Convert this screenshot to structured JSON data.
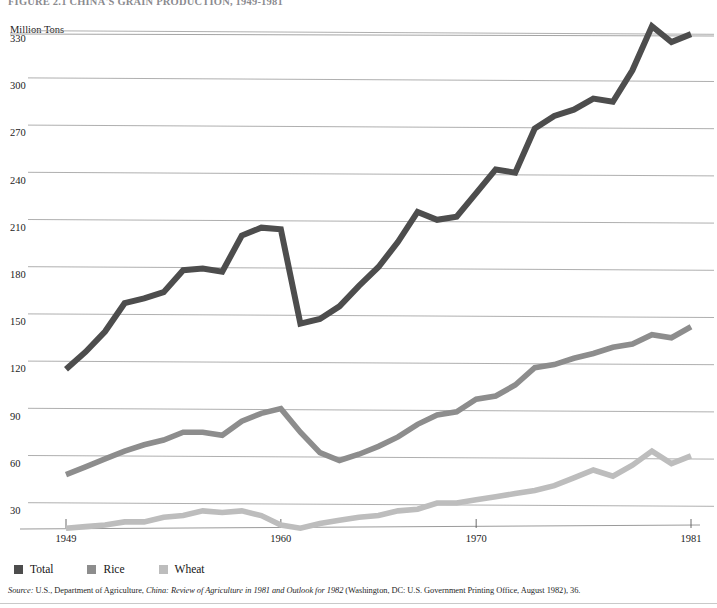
{
  "figure": {
    "title": "FIGURE 2.1 CHINA'S GRAIN PRODUCTION, 1949-1981",
    "unit_label": "Million Tons",
    "source_prefix": "Source:",
    "source_text_1": " U.S., Department of Agriculture, ",
    "source_italic": "China: Review of Agriculture in 1981 and Outlook for 1982",
    "source_text_2": " (Washington, DC: U.S. Government Printing Office, August 1982), 36."
  },
  "legend": {
    "position": "bottom-left",
    "items": [
      {
        "label": "Total",
        "color": "#4d4d4d"
      },
      {
        "label": "Rice",
        "color": "#8d8d8d"
      },
      {
        "label": "Wheat",
        "color": "#bdbdbd"
      }
    ]
  },
  "chart_data": {
    "type": "line",
    "title": "CHINA'S GRAIN PRODUCTION, 1949-1981",
    "xlabel": "",
    "ylabel": "Million Tons",
    "xlim": [
      1949,
      1981
    ],
    "ylim": [
      0,
      345
    ],
    "grid": true,
    "yticks": [
      30,
      60,
      90,
      120,
      150,
      180,
      210,
      240,
      270,
      300,
      330
    ],
    "xticks": [
      1949,
      1960,
      1970,
      1981
    ],
    "x": [
      1949,
      1950,
      1951,
      1952,
      1953,
      1954,
      1955,
      1956,
      1957,
      1958,
      1959,
      1960,
      1961,
      1962,
      1963,
      1964,
      1965,
      1966,
      1967,
      1968,
      1969,
      1970,
      1971,
      1972,
      1973,
      1974,
      1975,
      1976,
      1977,
      1978,
      1979,
      1980,
      1981
    ],
    "series": [
      {
        "name": "Total",
        "color": "#4d4d4d",
        "values": [
          115,
          126,
          139,
          157,
          160,
          164,
          178,
          179,
          177,
          200,
          205,
          204,
          144,
          147,
          155,
          168,
          180,
          196,
          215,
          210,
          212,
          227,
          242,
          240,
          268,
          276,
          280,
          287,
          285,
          305,
          333,
          323,
          328
        ]
      },
      {
        "name": "Rice",
        "color": "#8d8d8d",
        "values": [
          48,
          53,
          58,
          63,
          67,
          70,
          75,
          75,
          73,
          82,
          87,
          90,
          75,
          62,
          57,
          61,
          66,
          72,
          80,
          86,
          88,
          96,
          98,
          105,
          116,
          118,
          122,
          125,
          129,
          131,
          137,
          135,
          142
        ]
      },
      {
        "name": "Wheat",
        "color": "#bdbdbd",
        "values": [
          14,
          15,
          16,
          18,
          18,
          21,
          22,
          25,
          24,
          25,
          22,
          16,
          14,
          17,
          19,
          21,
          22,
          25,
          26,
          30,
          30,
          32,
          34,
          36,
          38,
          41,
          46,
          51,
          47,
          54,
          63,
          55,
          60
        ]
      }
    ]
  }
}
